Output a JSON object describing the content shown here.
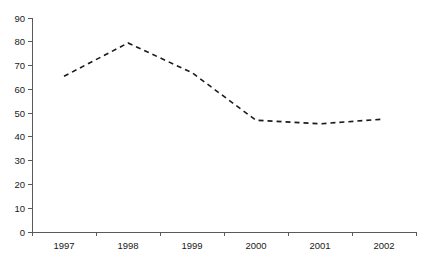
{
  "chart_data": {
    "type": "line",
    "title": "",
    "subtitle": "",
    "xlabel": "",
    "ylabel": "",
    "categories": [
      "1997",
      "1998",
      "1999",
      "2000",
      "2001",
      "2002"
    ],
    "series": [
      {
        "name": "series-1",
        "values": [
          65.5,
          79.5,
          67,
          47,
          45.5,
          47.5
        ],
        "line_style": "dashed",
        "color": "#1b1b1b",
        "markers": false
      }
    ],
    "ylim": [
      0,
      90
    ],
    "y_ticks": [
      0,
      10,
      20,
      30,
      40,
      50,
      60,
      70,
      80,
      90
    ],
    "y_tick_labels": [
      "0",
      "10",
      "20",
      "30",
      "40",
      "50",
      "60",
      "70",
      "80",
      "90"
    ],
    "x_tick_labels": [
      "1997",
      "1998",
      "1999",
      "2000",
      "2001",
      "2002"
    ],
    "grid": false,
    "legend": false,
    "legend_position": "none",
    "annotations": [],
    "axis_color": "#5a5a5a",
    "background_color": "#ffffff"
  },
  "geometry": {
    "plot_left": 32,
    "plot_right": 416,
    "plot_top": 18,
    "plot_bottom": 232,
    "category_width": 64
  }
}
